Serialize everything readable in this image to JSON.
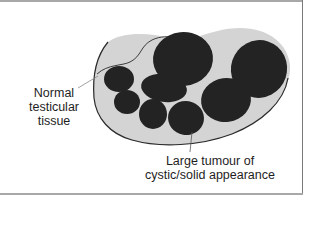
{
  "figure": {
    "labels": {
      "normal_tissue": {
        "line1": "Normal",
        "line2": "testicular",
        "line3": "tissue"
      },
      "tumour": {
        "line1": "Large tumour of",
        "line2": "cystic/solid appearance"
      }
    },
    "colors": {
      "tissue_fill": "#d4d4d4",
      "nodule_fill": "#232323",
      "outline": "#2a2a2a",
      "frame": "#a8a8a8"
    }
  }
}
